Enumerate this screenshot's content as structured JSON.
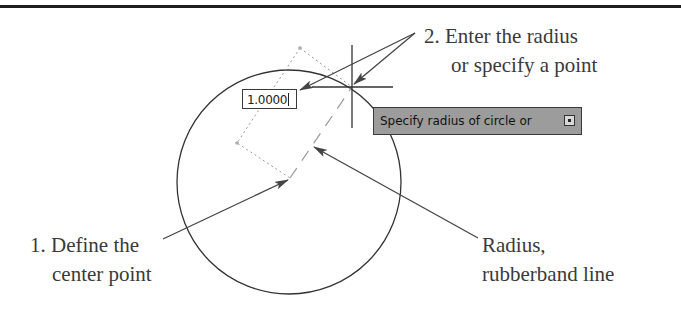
{
  "figure": {
    "callouts": {
      "step2_line1": "2. Enter the radius",
      "step2_line2": "or specify a point",
      "step1_line1": "1. Define the",
      "step1_line2": "center point",
      "radius_line1": "Radius,",
      "radius_line2": "rubberband line"
    },
    "dynamic_input": {
      "value": "1.0000"
    },
    "tooltip": {
      "prompt": "Specify radius of circle or",
      "expand_icon": "down-arrow-expand-icon"
    },
    "colors": {
      "rule": "#1e1e1e",
      "tooltip_bg": "#9c9c9c",
      "text": "#3a3a3a",
      "arrow": "#444444"
    }
  }
}
